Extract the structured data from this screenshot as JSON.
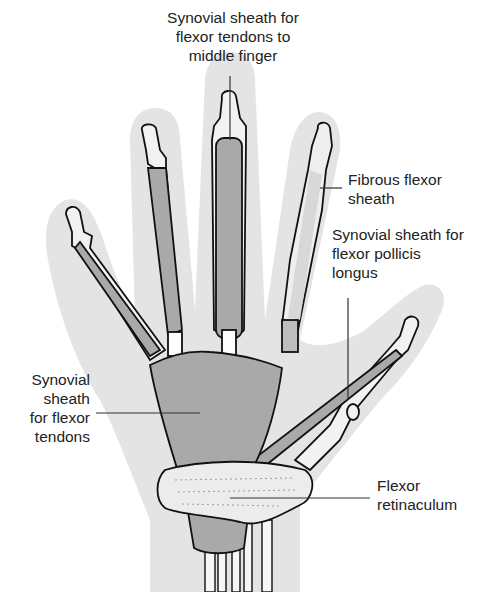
{
  "diagram": {
    "colors": {
      "skin": "#e4e4e4",
      "bone": "#f2f2f2",
      "sheath": "#a9a9a9",
      "outline": "#111111",
      "leader": "#333333",
      "text": "#222222"
    }
  },
  "labels": {
    "middle_finger_sheath": {
      "line1": "Synovial sheath for",
      "line2": "flexor tendons to",
      "line3": "middle finger"
    },
    "fibrous_sheath": {
      "line1": "Fibrous flexor",
      "line2": "sheath"
    },
    "pollicis_sheath": {
      "line1": "Synovial sheath for",
      "line2": "flexor pollicis",
      "line3": "longus"
    },
    "common_sheath": {
      "line1": "Synovial",
      "line2": "sheath",
      "line3": "for flexor",
      "line4": "tendons"
    },
    "retinaculum": {
      "line1": "Flexor",
      "line2": "retinaculum"
    }
  }
}
